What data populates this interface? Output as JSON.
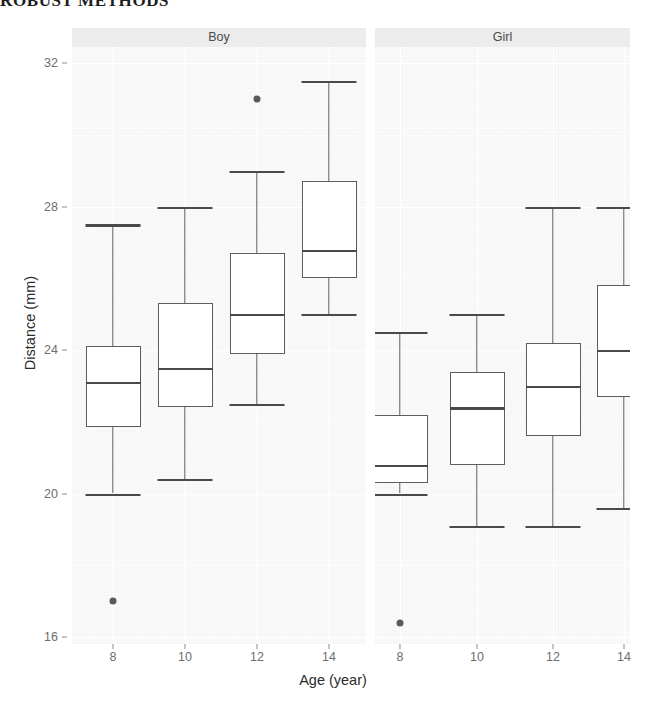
{
  "running_head": "ROBUST METHODS",
  "chart_data": {
    "type": "box",
    "title": "",
    "xlabel": "Age (year)",
    "ylabel": "Distance (mm)",
    "ylim": [
      15.3,
      32.4
    ],
    "yticks": [
      32,
      28,
      24,
      20,
      16
    ],
    "ytick_labels": [
      "32",
      "28",
      "24",
      "20",
      "16"
    ],
    "xticks": [
      8,
      10,
      12,
      14
    ],
    "xtick_labels": [
      "8",
      "10",
      "12",
      "14"
    ],
    "grid": true,
    "legend": "none",
    "facet_variable": "Sex",
    "panels": [
      {
        "label": "Boy",
        "boxes": [
          {
            "category": "8",
            "whisker_low": 20.0,
            "q1": 21.85,
            "median": 23.1,
            "q3": 24.1,
            "whisker_high": 27.5,
            "outliers": [
              17.0
            ]
          },
          {
            "category": "10",
            "whisker_low": 20.4,
            "q1": 22.4,
            "median": 23.5,
            "q3": 25.3,
            "whisker_high": 28.0,
            "outliers": []
          },
          {
            "category": "12",
            "whisker_low": 22.5,
            "q1": 23.9,
            "median": 25.0,
            "q3": 26.7,
            "whisker_high": 29.0,
            "outliers": [
              31.0
            ]
          },
          {
            "category": "14",
            "whisker_low": 25.0,
            "q1": 26.0,
            "median": 26.8,
            "q3": 28.7,
            "whisker_high": 31.5,
            "outliers": []
          }
        ]
      },
      {
        "label": "Girl",
        "boxes": [
          {
            "category": "8",
            "whisker_low": 20.0,
            "q1": 20.3,
            "median": 20.8,
            "q3": 22.2,
            "whisker_high": 24.5,
            "outliers": [
              16.4
            ]
          },
          {
            "category": "10",
            "whisker_low": 19.1,
            "q1": 20.8,
            "median": 22.4,
            "q3": 23.4,
            "whisker_high": 25.0,
            "outliers": []
          },
          {
            "category": "12",
            "whisker_low": 19.1,
            "q1": 21.6,
            "median": 23.0,
            "q3": 24.2,
            "whisker_high": 28.0,
            "outliers": []
          },
          {
            "category": "14",
            "whisker_low": 19.6,
            "q1": 22.7,
            "median": 24.0,
            "q3": 25.8,
            "whisker_high": 28.0,
            "outliers": []
          }
        ]
      }
    ],
    "colors": {
      "panel_background": "#fafafa",
      "strip_background": "#ececec",
      "grid": "#ffffff",
      "box_border": "#5d5d5d",
      "box_fill": "#ffffff",
      "median": "#4a4a4a",
      "outlier": "#5a5a5a",
      "tick_text": "#6e6e6e",
      "axis_title": "#2c2c2c"
    }
  }
}
